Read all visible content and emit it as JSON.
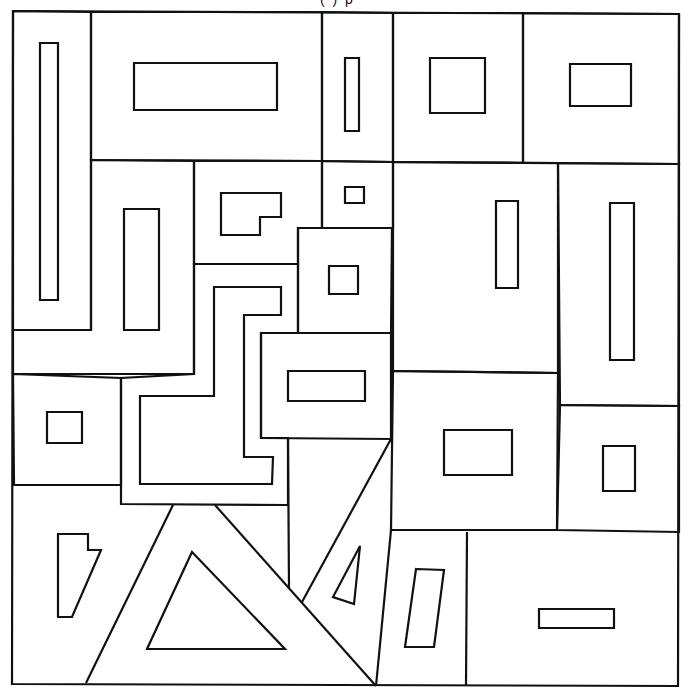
{
  "page": {
    "width": 691,
    "height": 697,
    "background": "#ffffff",
    "stroke_color": "#111111",
    "top_cutoff_text": "( ) p"
  },
  "drawing": {
    "outer_border": [
      [
        13,
        11
      ],
      [
        679,
        14
      ],
      [
        678,
        686
      ],
      [
        12,
        684
      ]
    ],
    "regions": [
      {
        "name": "tall-left-cell",
        "points": [
          [
            13,
            11
          ],
          [
            91,
            12
          ],
          [
            91,
            330
          ],
          [
            13,
            330
          ]
        ]
      },
      {
        "name": "top-wide-cell",
        "points": [
          [
            91,
            12
          ],
          [
            322,
            12
          ],
          [
            322,
            161
          ],
          [
            91,
            160
          ]
        ]
      },
      {
        "name": "top-narrow-cell",
        "points": [
          [
            322,
            12
          ],
          [
            393,
            13
          ],
          [
            393,
            162
          ],
          [
            322,
            161
          ]
        ]
      },
      {
        "name": "top-square-cell",
        "points": [
          [
            393,
            13
          ],
          [
            523,
            13
          ],
          [
            523,
            163
          ],
          [
            393,
            162
          ]
        ]
      },
      {
        "name": "top-right-cell",
        "points": [
          [
            523,
            13
          ],
          [
            679,
            14
          ],
          [
            679,
            164
          ],
          [
            523,
            163
          ]
        ]
      },
      {
        "name": "mid-left-cell",
        "points": [
          [
            91,
            160
          ],
          [
            194,
            161
          ],
          [
            194,
            374
          ],
          [
            13,
            374
          ],
          [
            13,
            330
          ],
          [
            91,
            330
          ]
        ]
      },
      {
        "name": "l-room-cell",
        "points": [
          [
            194,
            161
          ],
          [
            322,
            161
          ],
          [
            322,
            228
          ],
          [
            298,
            228
          ],
          [
            298,
            264
          ],
          [
            194,
            264
          ]
        ]
      },
      {
        "name": "tiny-square-cell",
        "points": [
          [
            322,
            161
          ],
          [
            393,
            162
          ],
          [
            393,
            228
          ],
          [
            322,
            228
          ]
        ]
      },
      {
        "name": "small-square-cell",
        "points": [
          [
            298,
            228
          ],
          [
            392,
            228
          ],
          [
            391,
            333
          ],
          [
            298,
            333
          ]
        ]
      },
      {
        "name": "right-u-cell",
        "points": [
          [
            393,
            162
          ],
          [
            558,
            163
          ],
          [
            558,
            373
          ],
          [
            393,
            371
          ]
        ]
      },
      {
        "name": "tall-right-cell",
        "points": [
          [
            558,
            163
          ],
          [
            679,
            164
          ],
          [
            679,
            406
          ],
          [
            560,
            405
          ]
        ]
      },
      {
        "name": "s-path-cell",
        "points": [
          [
            194,
            264
          ],
          [
            298,
            264
          ],
          [
            298,
            333
          ],
          [
            261,
            333
          ],
          [
            261,
            438
          ],
          [
            288,
            438
          ],
          [
            288,
            505
          ],
          [
            121,
            504
          ],
          [
            121,
            378
          ],
          [
            194,
            374
          ]
        ]
      },
      {
        "name": "mid-bar-cell",
        "points": [
          [
            261,
            333
          ],
          [
            391,
            333
          ],
          [
            391,
            439
          ],
          [
            261,
            438
          ]
        ]
      },
      {
        "name": "left-small-square-cell",
        "points": [
          [
            13,
            374
          ],
          [
            121,
            378
          ],
          [
            121,
            485
          ],
          [
            14,
            485
          ]
        ]
      },
      {
        "name": "center-square-cell",
        "points": [
          [
            393,
            371
          ],
          [
            558,
            373
          ],
          [
            557,
            530
          ],
          [
            391,
            530
          ]
        ]
      },
      {
        "name": "right-small-rect-cell",
        "points": [
          [
            560,
            405
          ],
          [
            679,
            406
          ],
          [
            679,
            532
          ],
          [
            557,
            530
          ]
        ]
      }
    ],
    "dividers": [
      {
        "name": "big-triangle-left-edge",
        "points": [
          [
            86,
            683
          ],
          [
            173,
            505
          ]
        ]
      },
      {
        "name": "big-triangle-right-edge",
        "points": [
          [
            215,
            505
          ],
          [
            376,
            686
          ]
        ]
      },
      {
        "name": "small-triangle-left-edge",
        "points": [
          [
            391,
            439
          ],
          [
            302,
            602
          ]
        ]
      },
      {
        "name": "vertical-288",
        "points": [
          [
            288,
            438
          ],
          [
            289,
            589
          ]
        ]
      },
      {
        "name": "lower-slanted-vertical",
        "points": [
          [
            391,
            530
          ],
          [
            376,
            686
          ]
        ]
      },
      {
        "name": "lower-right-vertical",
        "points": [
          [
            467,
            532
          ],
          [
            466,
            685
          ]
        ]
      },
      {
        "name": "left-lower-horizontal",
        "points": [
          [
            14,
            485
          ],
          [
            121,
            485
          ]
        ]
      }
    ],
    "inner_shapes": [
      {
        "name": "tall-thin-rect",
        "points": [
          [
            40,
            43
          ],
          [
            58,
            43
          ],
          [
            58,
            300
          ],
          [
            40,
            300
          ]
        ]
      },
      {
        "name": "wide-rect",
        "points": [
          [
            134,
            63
          ],
          [
            277,
            63
          ],
          [
            277,
            110
          ],
          [
            134,
            110
          ]
        ]
      },
      {
        "name": "narrow-rect",
        "points": [
          [
            345,
            58
          ],
          [
            359,
            58
          ],
          [
            359,
            131
          ],
          [
            345,
            131
          ]
        ]
      },
      {
        "name": "square-rect",
        "points": [
          [
            430,
            58
          ],
          [
            485,
            58
          ],
          [
            485,
            113
          ],
          [
            430,
            113
          ]
        ]
      },
      {
        "name": "right-rect",
        "points": [
          [
            570,
            64
          ],
          [
            631,
            64
          ],
          [
            631,
            106
          ],
          [
            570,
            106
          ]
        ]
      },
      {
        "name": "left-tall-rect",
        "points": [
          [
            124,
            209
          ],
          [
            159,
            209
          ],
          [
            159,
            330
          ],
          [
            124,
            330
          ]
        ]
      },
      {
        "name": "l-shape",
        "points": [
          [
            221,
            193
          ],
          [
            281,
            193
          ],
          [
            281,
            217
          ],
          [
            260,
            217
          ],
          [
            260,
            235
          ],
          [
            221,
            235
          ]
        ]
      },
      {
        "name": "tiny-square",
        "points": [
          [
            345,
            187
          ],
          [
            364,
            187
          ],
          [
            364,
            203
          ],
          [
            345,
            203
          ]
        ]
      },
      {
        "name": "small-square",
        "points": [
          [
            329,
            266
          ],
          [
            358,
            266
          ],
          [
            358,
            294
          ],
          [
            329,
            294
          ]
        ]
      },
      {
        "name": "u-inner-rect",
        "points": [
          [
            496,
            201
          ],
          [
            518,
            201
          ],
          [
            518,
            288
          ],
          [
            496,
            288
          ]
        ]
      },
      {
        "name": "tall-right-rect",
        "points": [
          [
            610,
            203
          ],
          [
            634,
            203
          ],
          [
            634,
            360
          ],
          [
            610,
            360
          ]
        ]
      },
      {
        "name": "s-path-inner",
        "points": [
          [
            214,
            287
          ],
          [
            281,
            287
          ],
          [
            281,
            315
          ],
          [
            244,
            315
          ],
          [
            244,
            457
          ],
          [
            273,
            457
          ],
          [
            272,
            484
          ],
          [
            140,
            484
          ],
          [
            140,
            396
          ],
          [
            214,
            396
          ]
        ]
      },
      {
        "name": "mid-bar-rect",
        "points": [
          [
            288,
            371
          ],
          [
            365,
            371
          ],
          [
            365,
            401
          ],
          [
            288,
            401
          ]
        ]
      },
      {
        "name": "left-small-square",
        "points": [
          [
            47,
            412
          ],
          [
            82,
            412
          ],
          [
            82,
            443
          ],
          [
            47,
            443
          ]
        ]
      },
      {
        "name": "center-rect",
        "points": [
          [
            444,
            430
          ],
          [
            512,
            430
          ],
          [
            512,
            475
          ],
          [
            444,
            475
          ]
        ]
      },
      {
        "name": "right-small-rect",
        "points": [
          [
            603,
            446
          ],
          [
            635,
            446
          ],
          [
            635,
            491
          ],
          [
            603,
            491
          ]
        ]
      },
      {
        "name": "notched-quad",
        "points": [
          [
            58,
            534
          ],
          [
            88,
            534
          ],
          [
            88,
            550
          ],
          [
            101,
            550
          ],
          [
            72,
            617
          ],
          [
            58,
            617
          ]
        ]
      },
      {
        "name": "inner-big-triangle",
        "points": [
          [
            192,
            552
          ],
          [
            285,
            649
          ],
          [
            147,
            649
          ]
        ]
      },
      {
        "name": "inner-small-triangle",
        "points": [
          [
            360,
            546
          ],
          [
            354,
            604
          ],
          [
            333,
            597
          ]
        ]
      },
      {
        "name": "tilted-rect",
        "points": [
          [
            416,
            569
          ],
          [
            444,
            570
          ],
          [
            434,
            647
          ],
          [
            405,
            647
          ]
        ]
      },
      {
        "name": "bottom-bar-rect",
        "points": [
          [
            539,
            609
          ],
          [
            614,
            609
          ],
          [
            614,
            628
          ],
          [
            539,
            628
          ]
        ]
      }
    ]
  }
}
